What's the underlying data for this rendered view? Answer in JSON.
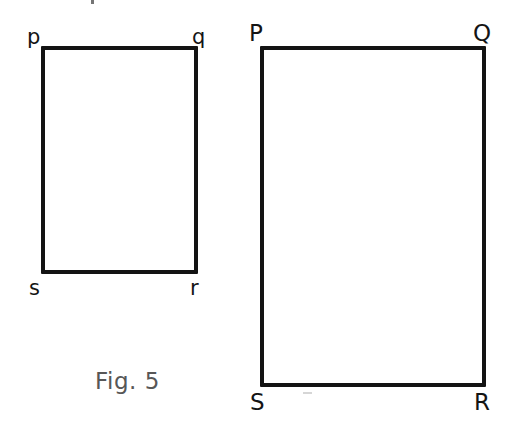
{
  "figure": {
    "caption": "Fig. 5",
    "background_color": "#ffffff",
    "stroke_color": "#131313",
    "label_color": "#141414",
    "caption_color": "#575757",
    "shapes": [
      {
        "name": "small-rectangle",
        "kind": "rectangle",
        "filled": false,
        "stroke_width": 4,
        "x": 41,
        "y": 46,
        "width": 157,
        "height": 228,
        "vertices": [
          {
            "id": "p",
            "label": "p",
            "corner": "top-left"
          },
          {
            "id": "q",
            "label": "q",
            "corner": "top-right"
          },
          {
            "id": "r",
            "label": "r",
            "corner": "bottom-right"
          },
          {
            "id": "s",
            "label": "s",
            "corner": "bottom-left"
          }
        ]
      },
      {
        "name": "large-rectangle",
        "kind": "rectangle",
        "filled": false,
        "stroke_width": 4,
        "x": 260,
        "y": 46,
        "width": 226,
        "height": 341,
        "vertices": [
          {
            "id": "P",
            "label": "P",
            "corner": "top-left"
          },
          {
            "id": "Q",
            "label": "Q",
            "corner": "top-right"
          },
          {
            "id": "R",
            "label": "R",
            "corner": "bottom-right"
          },
          {
            "id": "S",
            "label": "S",
            "corner": "bottom-left"
          }
        ]
      }
    ]
  }
}
